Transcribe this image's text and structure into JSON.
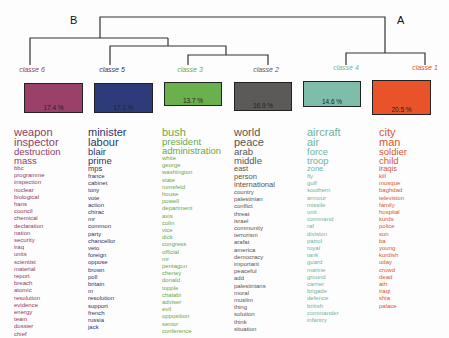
{
  "diagram": {
    "type": "dendrogram",
    "nodes": {
      "left_label": "B",
      "right_label": "A"
    },
    "classes": [
      {
        "id": "classe-6",
        "label": "classe  6",
        "percent": "17.4 %",
        "color": "#9b4069",
        "text_color": "#8e3c64",
        "words": {
          "large": [
            "weapon",
            "inspector"
          ],
          "medium": [
            "destruction",
            "mass"
          ],
          "small": [
            "bbc",
            "programme",
            "inspection",
            "nuclear",
            "biological",
            "hans",
            "council",
            "chemical",
            "declaration",
            "nation",
            "security",
            "iraq",
            "units",
            "scientist",
            "material",
            "report",
            "breach",
            "atomic",
            "resolution",
            "evidence",
            "energy",
            "team",
            "dossier",
            "chief"
          ]
        }
      },
      {
        "id": "classe-5",
        "label": "classe  5",
        "percent": "17.1 %",
        "color": "#2e3b7a",
        "text_color": "#2e3568",
        "words": {
          "large": [
            "minister",
            "labour"
          ],
          "medium": [
            "blair",
            "prime",
            "mps"
          ],
          "small": [
            "france",
            "cabinet",
            "tony",
            "vote",
            "action",
            "chirac",
            "mr",
            "common",
            "party",
            "chancellor",
            "veto",
            "foreign",
            "oppose",
            "brown",
            "poll",
            "britain",
            "m",
            "resolution",
            "support",
            "french",
            "russia",
            "jack"
          ]
        }
      },
      {
        "id": "classe-3",
        "label": "classe  3",
        "percent": "13.7 %",
        "color": "#6ab04c",
        "text_color": "#6aa84a",
        "words": {
          "large": [
            "bush"
          ],
          "medium": [
            "president",
            "administration"
          ],
          "small": [
            "white",
            "george",
            "washington",
            "state",
            "rumsfeld",
            "house",
            "powell",
            "department",
            "axis",
            "colin",
            "vice",
            "dick",
            "congress",
            "official",
            "mr",
            "pentagon",
            "cheney",
            "donald",
            "topple",
            "chalabi",
            "adviser",
            "evil",
            "opposition",
            "senior",
            "conference"
          ]
        }
      },
      {
        "id": "classe-2",
        "label": "classe  2",
        "percent": "16.9 %",
        "color": "#5c5a59",
        "text_color": "#555555",
        "words": {
          "large": [
            "world",
            "peace"
          ],
          "medium": [
            "arab",
            "middle",
            "east",
            "person",
            "international"
          ],
          "small": [
            "country",
            "palestinian",
            "conflict",
            "threat",
            "israel",
            "community",
            "terrorism",
            "arafat",
            "america",
            "democracy",
            "important",
            "peaceful",
            "add",
            "palestinians",
            "moral",
            "muslim",
            "thing",
            "solution",
            "think",
            "situation"
          ]
        }
      },
      {
        "id": "classe-4",
        "label": "classe  4",
        "percent": "14.6 %",
        "color": "#7ebda9",
        "text_color": "#6fb3a3",
        "words": {
          "large": [
            "aircraft",
            "air"
          ],
          "medium": [
            "force",
            "troop",
            "zone"
          ],
          "small": [
            "fly",
            "gulf",
            "southern",
            "armour",
            "missile",
            "unit",
            "command",
            "raf",
            "division",
            "patrol",
            "royal",
            "tank",
            "guard",
            "marine",
            "ground",
            "carrier",
            "brigade",
            "defence",
            "british",
            "commander",
            "infantry"
          ]
        }
      },
      {
        "id": "classe-1",
        "label": "classe  1",
        "percent": "20.5 %",
        "color": "#e8532a",
        "text_color": "#d9562c",
        "words": {
          "large": [
            "city",
            "man"
          ],
          "medium": [
            "soldier",
            "child",
            "iraqis"
          ],
          "small": [
            "kill",
            "mosque",
            "baghdad",
            "television",
            "family",
            "hospital",
            "kurds",
            "police",
            "son",
            "ba",
            "young",
            "kurdish",
            "uday",
            "crowd",
            "dead",
            "ath",
            "iraqi",
            "shia",
            "palace"
          ]
        }
      }
    ]
  }
}
